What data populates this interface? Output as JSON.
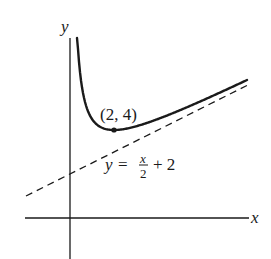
{
  "diagram": {
    "type": "function-graph",
    "axes": {
      "x_label": "x",
      "y_label": "y"
    },
    "curve": {
      "description": "solid curve approaching the y-axis from above and rising toward an oblique asymptote",
      "formula_implied": "y = x/2 + 2/x + 2"
    },
    "point": {
      "label": "(2, 4)",
      "x": 2,
      "y": 4
    },
    "asymptote": {
      "style": "dashed",
      "label_lhs": "y =",
      "label_num": "x",
      "label_den": "2",
      "label_rhs": "+ 2"
    }
  },
  "colors": {
    "ink": "#1a1a1a",
    "background": "#ffffff"
  }
}
